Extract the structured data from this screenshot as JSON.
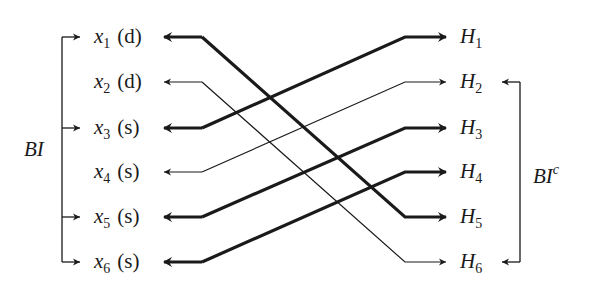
{
  "diagram": {
    "left_group": {
      "label_base": "BI",
      "members": [
        "x1",
        "x3",
        "x5",
        "x6"
      ]
    },
    "right_group": {
      "label_base": "BI",
      "label_sup": "c",
      "members": [
        "H2",
        "H6"
      ]
    },
    "left_nodes": [
      {
        "id": "x1",
        "var": "x",
        "sub": "1",
        "tag": "(d)",
        "y": 37
      },
      {
        "id": "x2",
        "var": "x",
        "sub": "2",
        "tag": "(d)",
        "y": 82
      },
      {
        "id": "x3",
        "var": "x",
        "sub": "3",
        "tag": "(s)",
        "y": 128
      },
      {
        "id": "x4",
        "var": "x",
        "sub": "4",
        "tag": "(s)",
        "y": 172
      },
      {
        "id": "x5",
        "var": "x",
        "sub": "5",
        "tag": "(s)",
        "y": 217
      },
      {
        "id": "x6",
        "var": "x",
        "sub": "6",
        "tag": "(s)",
        "y": 262
      }
    ],
    "right_nodes": [
      {
        "id": "H1",
        "var": "H",
        "sub": "1",
        "y": 37
      },
      {
        "id": "H2",
        "var": "H",
        "sub": "2",
        "y": 82
      },
      {
        "id": "H3",
        "var": "H",
        "sub": "3",
        "y": 128
      },
      {
        "id": "H4",
        "var": "H",
        "sub": "4",
        "y": 172
      },
      {
        "id": "H5",
        "var": "H",
        "sub": "5",
        "y": 217
      },
      {
        "id": "H6",
        "var": "H",
        "sub": "6",
        "y": 262
      }
    ],
    "edges": [
      {
        "from": "x1",
        "to": "H5",
        "weight": "thick",
        "bidirectional": true
      },
      {
        "from": "x2",
        "to": "H6",
        "weight": "thin",
        "bidirectional": true
      },
      {
        "from": "x3",
        "to": "H1",
        "weight": "thick",
        "bidirectional": true
      },
      {
        "from": "x4",
        "to": "H2",
        "weight": "thin",
        "bidirectional": true
      },
      {
        "from": "x5",
        "to": "H3",
        "weight": "thick",
        "bidirectional": true
      },
      {
        "from": "x6",
        "to": "H4",
        "weight": "thick",
        "bidirectional": true
      }
    ],
    "colors": {
      "stroke": "#1a1a1a",
      "background": "#ffffff"
    }
  }
}
